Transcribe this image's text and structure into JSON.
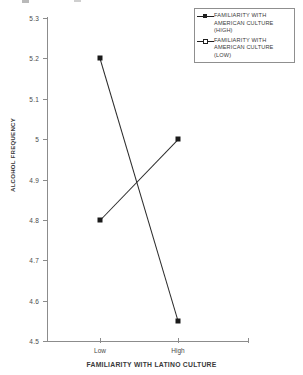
{
  "chart_data": {
    "type": "line",
    "title": "",
    "xlabel": "FAMILIARITY WITH LATINO CULTURE",
    "ylabel": "ALCOHOL FREQUENCY",
    "categories": [
      "Low",
      "High"
    ],
    "ylim": [
      4.5,
      5.3
    ],
    "ytick_labels": [
      "5.3",
      "5.2",
      "5.1",
      "5",
      "4.9",
      "4.8",
      "4.7",
      "4.6",
      "4.5"
    ],
    "ytick_values": [
      5.3,
      5.2,
      5.1,
      5.0,
      4.9,
      4.8,
      4.7,
      4.6,
      4.5
    ],
    "grid": false,
    "legend_position": "top-right",
    "series": [
      {
        "name": "FAMILIARITY WITH AMERICAN CULTURE (HIGH)",
        "marker": "filled-square",
        "values": [
          5.2,
          4.55
        ]
      },
      {
        "name": "FAMILIARITY WITH AMERICAN CULTURE (LOW)",
        "marker": "square",
        "values": [
          4.8,
          5.0
        ]
      }
    ]
  },
  "legend": {
    "items": [
      {
        "label": "FAMILIARITY WITH AMERICAN CULTURE (HIGH)"
      },
      {
        "label": "FAMILIARITY WITH AMERICAN CULTURE (LOW)"
      }
    ]
  }
}
